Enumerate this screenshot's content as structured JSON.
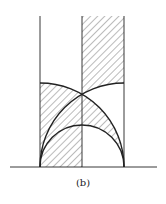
{
  "figure": {
    "caption": "(b)",
    "colors": {
      "line": "#222222",
      "hatch": "#555555",
      "background": "#ffffff"
    },
    "geometry": {
      "baseline_y": 167,
      "baseline_x": [
        10,
        157
      ],
      "verticals_x": [
        40,
        82,
        124
      ],
      "vertical_top_y": 16,
      "circles": [
        {
          "name": "arc-a",
          "cx": 40,
          "cy": 167,
          "r": 84
        },
        {
          "name": "arc-b",
          "cx": 124,
          "cy": 167,
          "r": 84
        },
        {
          "name": "semicircle-c",
          "cx": 82,
          "cy": 167,
          "r": 42
        }
      ],
      "intersection": [
        82,
        94
      ]
    },
    "hatched_regions": [
      "right strip above arc-b",
      "left strip below arc-a",
      "right strip between arc-a and semicircle-c"
    ]
  }
}
